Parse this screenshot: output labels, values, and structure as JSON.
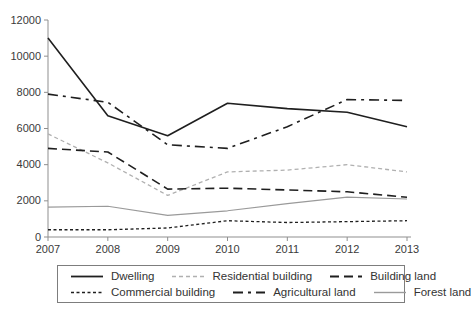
{
  "chart_data": {
    "type": "line",
    "title": "",
    "xlabel": "",
    "ylabel": "",
    "x": [
      2007,
      2008,
      2009,
      2010,
      2011,
      2012,
      2013
    ],
    "x_tick_labels": [
      "2007",
      "2008",
      "2009",
      "2010",
      "2011",
      "2012",
      "2013"
    ],
    "y_ticks": [
      0,
      2000,
      4000,
      6000,
      8000,
      10000,
      12000
    ],
    "ylim": [
      0,
      12000
    ],
    "grid": false,
    "legend_position": "bottom-box",
    "series": [
      {
        "name": "Dwelling",
        "values": [
          11000,
          6700,
          5600,
          7400,
          7100,
          6900,
          6100
        ],
        "color": "#1f1f1f",
        "dash": "",
        "width": 1.6
      },
      {
        "name": "Residential building",
        "values": [
          5700,
          4100,
          2300,
          3600,
          3700,
          4000,
          3600
        ],
        "color": "#b0b0b0",
        "dash": "4,3",
        "width": 1.3
      },
      {
        "name": "Building land",
        "values": [
          4900,
          4700,
          2650,
          2700,
          2600,
          2500,
          2200
        ],
        "color": "#1f1f1f",
        "dash": "9,5",
        "width": 1.6
      },
      {
        "name": "Commercial building",
        "values": [
          400,
          400,
          500,
          900,
          800,
          850,
          900
        ],
        "color": "#1f1f1f",
        "dash": "3,2.5",
        "width": 1.3
      },
      {
        "name": "Agricultural land",
        "values": [
          7900,
          7450,
          5100,
          4900,
          6100,
          7600,
          7550
        ],
        "color": "#1f1f1f",
        "dash": "10,5,3,5",
        "width": 1.6
      },
      {
        "name": "Forest land",
        "values": [
          1650,
          1700,
          1200,
          1450,
          1850,
          2200,
          2100
        ],
        "color": "#9a9a9a",
        "dash": "",
        "width": 1.2
      }
    ],
    "legend_rows": [
      [
        "Dwelling",
        "Residential building",
        "Building land"
      ],
      [
        "Commercial building",
        "Agricultural land",
        "Forest land"
      ]
    ],
    "axis_color": "#8f8f8f",
    "tick_label_color": "#3a3a3a"
  }
}
